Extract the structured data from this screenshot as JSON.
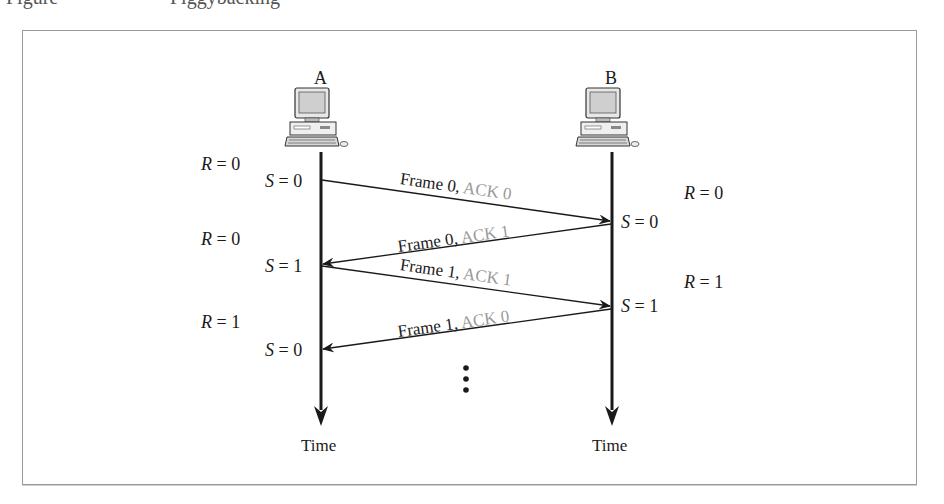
{
  "caption": {
    "figure_label": "Figure",
    "title": "Piggybacking"
  },
  "nodes": [
    {
      "id": "A",
      "label": "A",
      "icon": "desktop-computer-icon",
      "timeline_label": "Time"
    },
    {
      "id": "B",
      "label": "B",
      "icon": "desktop-computer-icon",
      "timeline_label": "Time"
    }
  ],
  "state_labels": {
    "A": [
      {
        "var": "R",
        "value": "0"
      },
      {
        "var": "S",
        "value": "0"
      },
      {
        "var": "R",
        "value": "0"
      },
      {
        "var": "S",
        "value": "1"
      },
      {
        "var": "R",
        "value": "1"
      },
      {
        "var": "S",
        "value": "0"
      }
    ],
    "B": [
      {
        "var": "R",
        "value": "0"
      },
      {
        "var": "S",
        "value": "0"
      },
      {
        "var": "R",
        "value": "1"
      },
      {
        "var": "S",
        "value": "1"
      }
    ]
  },
  "messages": [
    {
      "from": "A",
      "to": "B",
      "frame": "Frame 0,",
      "ack": "ACK 0"
    },
    {
      "from": "B",
      "to": "A",
      "frame": "Frame 0,",
      "ack": "ACK 1"
    },
    {
      "from": "A",
      "to": "B",
      "frame": "Frame 1,",
      "ack": "ACK 1"
    },
    {
      "from": "B",
      "to": "A",
      "frame": "Frame 1,",
      "ack": "ACK 0"
    }
  ],
  "continuation": "vertical-ellipsis",
  "colors": {
    "line": "#1a1a1a",
    "ack_text": "#9a9a9a",
    "frame_border": "#9a9a9a"
  }
}
